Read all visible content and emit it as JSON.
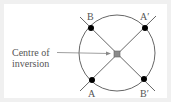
{
  "diagram": {
    "caption": {
      "line1": "Centre of",
      "line2": "inversion"
    },
    "points": {
      "B": {
        "label": "B",
        "x": 91,
        "y": 28
      },
      "A_prime": {
        "label": "A′",
        "x": 145,
        "y": 28
      },
      "A": {
        "label": "A",
        "x": 92,
        "y": 80
      },
      "B_prime": {
        "label": "B′",
        "x": 144,
        "y": 79
      }
    },
    "centre": {
      "x": 117,
      "y": 54
    },
    "circle": {
      "cx": 117,
      "cy": 53,
      "r": 38
    },
    "colors": {
      "line": "#555555",
      "point": "#000000",
      "centre_fill": "#8a8a8a",
      "text": "#555555",
      "arrow": "#888888"
    }
  }
}
